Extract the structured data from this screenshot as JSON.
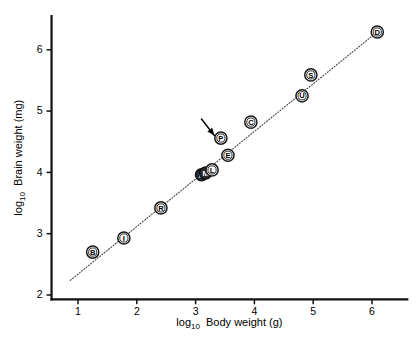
{
  "figure": {
    "background_color": "#ffffff",
    "width": 419,
    "height": 337
  },
  "chart_data": {
    "type": "scatter",
    "title": "",
    "xlabel_prefix": "log",
    "xlabel_sub": "10",
    "xlabel_main": "Body weight (g)",
    "ylabel_prefix": "log",
    "ylabel_sub": "10",
    "ylabel_main": "Brain weight (mg)",
    "xlabel": "log10 Body weight (g)",
    "ylabel": "log10 Brain weight (mg)",
    "xlim": [
      0.55,
      6.6
    ],
    "ylim": [
      1.93,
      6.55
    ],
    "xticks": [
      1,
      2,
      3,
      4,
      5,
      6
    ],
    "xtick_labels": [
      "1",
      "2",
      "3",
      "4",
      "5",
      "6"
    ],
    "yticks": [
      2,
      3,
      4,
      5,
      6
    ],
    "ytick_labels": [
      "2",
      "3",
      "4",
      "5",
      "6"
    ],
    "grid": false,
    "legend_position": "none",
    "marker_style": "circled-letter",
    "points": [
      {
        "label": "B",
        "x": 1.25,
        "y": 2.7,
        "style": "open"
      },
      {
        "label": "I",
        "x": 1.78,
        "y": 2.93,
        "style": "open"
      },
      {
        "label": "R",
        "x": 2.41,
        "y": 3.42,
        "style": "open"
      },
      {
        "label": "K",
        "x": 3.1,
        "y": 3.96,
        "style": "dark"
      },
      {
        "label": "M",
        "x": 3.17,
        "y": 3.99,
        "style": "dark"
      },
      {
        "label": "L",
        "x": 3.28,
        "y": 4.04,
        "style": "open"
      },
      {
        "label": "E",
        "x": 3.55,
        "y": 4.28,
        "style": "open"
      },
      {
        "label": "P",
        "x": 3.43,
        "y": 4.56,
        "style": "open"
      },
      {
        "label": "C",
        "x": 3.94,
        "y": 4.82,
        "style": "open"
      },
      {
        "label": "U",
        "x": 4.81,
        "y": 5.25,
        "style": "open"
      },
      {
        "label": "S",
        "x": 4.96,
        "y": 5.59,
        "style": "open"
      },
      {
        "label": "D",
        "x": 6.09,
        "y": 6.29,
        "style": "open"
      }
    ],
    "fit_line": {
      "style": "dotted",
      "x_start": 0.87,
      "y_start": 2.24,
      "x_end": 6.05,
      "y_end": 6.26,
      "color": "#4a4a4a"
    },
    "annotations": [
      {
        "type": "arrow",
        "target_label": "P",
        "tail_x": 3.1,
        "tail_y": 4.87,
        "tip_x": 3.32,
        "tip_y": 4.6,
        "color": "#000000"
      }
    ]
  },
  "colors": {
    "axis": "#111111",
    "marker_stroke": "#1a1a1a",
    "marker_fill": "#ffffff",
    "marker_dark_fill": "#2b2b2b",
    "fit_line": "#4a4a4a",
    "text": "#000000"
  }
}
